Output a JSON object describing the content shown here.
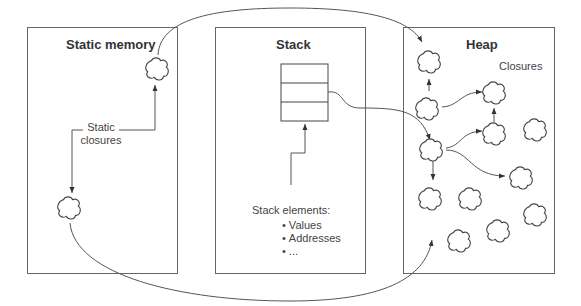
{
  "regions": {
    "static_memory": {
      "title": "Static memory",
      "label": "Static\nclosures",
      "label_lines": [
        "Static",
        "closures"
      ]
    },
    "stack": {
      "title": "Stack",
      "elements_heading": "Stack elements:",
      "elements": [
        "Values",
        "Addresses",
        "..."
      ],
      "frame_slots": 3
    },
    "heap": {
      "title": "Heap",
      "label": "Closures"
    }
  },
  "colors": {
    "stroke": "#555555",
    "text": "#333333",
    "background": "#ffffff"
  },
  "icons": {
    "closure": "cloud-icon",
    "pointer": "arrow-icon"
  }
}
